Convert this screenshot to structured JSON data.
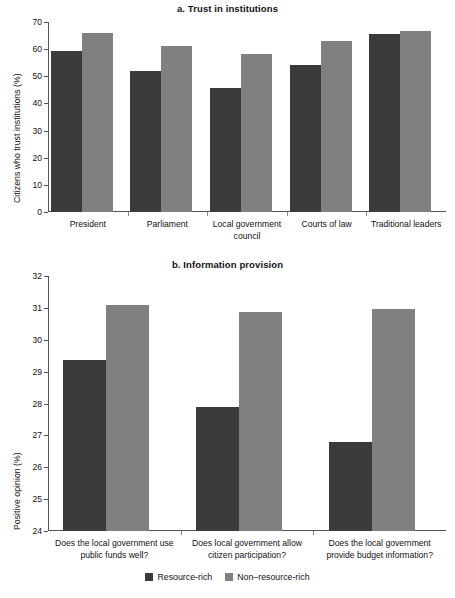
{
  "figure": {
    "legend": [
      {
        "label": "Resource-rich",
        "color": "#3b3b3b",
        "key": "resource_rich"
      },
      {
        "label": "Non–resource-rich",
        "color": "#808080",
        "key": "non_resource_rich"
      }
    ]
  },
  "chart_data": [
    {
      "type": "bar",
      "panel": "a",
      "title": "a. Trust in institutions",
      "xlabel": "",
      "ylabel": "Citizens who trust institutions (%)",
      "ylim": [
        0,
        70
      ],
      "yticks": [
        0,
        10,
        20,
        30,
        40,
        50,
        60,
        70
      ],
      "grid": false,
      "legend_position": "bottom-figure",
      "categories": [
        "President",
        "Parliament",
        "Local government council",
        "Courts of law",
        "Traditional leaders"
      ],
      "series": [
        {
          "name": "Resource-rich",
          "color": "#3b3b3b",
          "values": [
            59.5,
            51.9,
            45.7,
            54.3,
            65.6
          ]
        },
        {
          "name": "Non–resource-rich",
          "color": "#808080",
          "values": [
            66.1,
            61.3,
            58.2,
            62.9,
            66.8
          ]
        }
      ]
    },
    {
      "type": "bar",
      "panel": "b",
      "title": "b. Information provision",
      "xlabel": "",
      "ylabel": "Positive opinion (%)",
      "ylim": [
        24,
        32
      ],
      "yticks": [
        24,
        25,
        26,
        27,
        28,
        29,
        30,
        31,
        32
      ],
      "grid": false,
      "legend_position": "bottom-figure",
      "categories": [
        "Does the local government use public funds well?",
        "Does local government allow citizen participation?",
        "Does the local government provide budget information?"
      ],
      "series": [
        {
          "name": "Resource-rich",
          "color": "#3b3b3b",
          "values": [
            29.35,
            27.9,
            26.8
          ]
        },
        {
          "name": "Non–resource-rich",
          "color": "#808080",
          "values": [
            31.1,
            30.88,
            30.95
          ]
        }
      ]
    }
  ]
}
